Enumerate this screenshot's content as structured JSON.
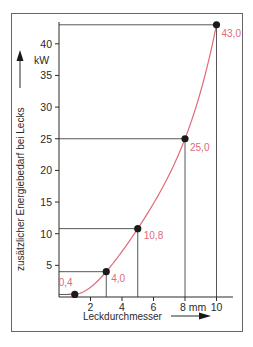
{
  "chart_data": {
    "type": "line",
    "title": "",
    "xlabel": "Leckdurchmesser",
    "ylabel": "zusätzlicher Energiebedarf bei Lecks",
    "x_unit": "mm",
    "y_unit": "kW",
    "xlim": [
      0,
      11
    ],
    "ylim": [
      0,
      44
    ],
    "x_ticks": [
      2,
      4,
      6,
      8,
      10
    ],
    "x_tick_labels": [
      "2",
      "4",
      "6",
      "8 mm",
      "10"
    ],
    "y_ticks": [
      5,
      10,
      15,
      20,
      25,
      30,
      35,
      40
    ],
    "y_tick_labels": [
      "5",
      "10",
      "15",
      "20",
      "25",
      "30",
      "35",
      "40"
    ],
    "grid": false,
    "legend": null,
    "series": [
      {
        "name": "zusätzlicher Energiebedarf",
        "color": "#e06a78",
        "x": [
          1,
          3,
          5,
          8,
          10
        ],
        "values": [
          0.4,
          4.0,
          10.8,
          25.0,
          43.0
        ],
        "labels": [
          "0,4",
          "4,0",
          "10,8",
          "25,0",
          "43,0"
        ]
      }
    ],
    "annotations": "Reference lines drop from each data point to both axes"
  },
  "colors": {
    "curve": "#e06a78",
    "axis": "#2a2a2a",
    "frame": "#555555",
    "point": "#1a1a1a"
  }
}
